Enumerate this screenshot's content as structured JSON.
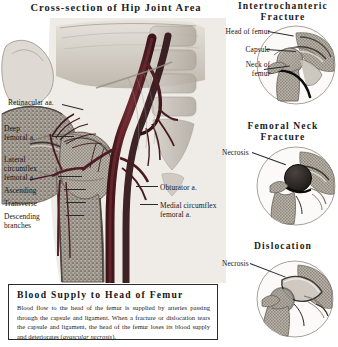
{
  "main": {
    "title": "Cross-section of Hip Joint Area",
    "labels": {
      "retinacular": "Retinacular aa.",
      "deep_femoral": "Deep\nfemoral a.",
      "lateral_circumflex": "Lateral\ncircumflex\nfemoral a.",
      "ascending": "Ascending",
      "transverse": "Transverse",
      "descending": "Descending\nbranches",
      "obturator": "Obturator a.",
      "medial_circumflex": "Medial circumflex\nfemoral a."
    }
  },
  "insets": [
    {
      "title": "Intertrochanteric\nFracture",
      "labels": [
        "Head of femur",
        "Capsule",
        "Neck of\nfemur"
      ]
    },
    {
      "title": "Femoral Neck\nFracture",
      "labels": [
        "Necrosis"
      ]
    },
    {
      "title": "Dislocation",
      "labels": [
        "Necrosis"
      ]
    }
  ],
  "caption": {
    "heading": "Blood Supply to Head of Femur",
    "body_part1": "Blood flow to the head of the femur is supplied by arteries passing through the capsule and ligament. When a fracture or dislocation tears the capsule and ligament, the head of the femur loses its blood supply and deteriorates (",
    "body_italic": "avascular necrosis",
    "body_part2": ")."
  },
  "colors": {
    "ink": "#1a1a1a",
    "artery": "#5a2128",
    "bone_light": "#d8d3cb",
    "bone_mid": "#a9a298",
    "bone_dark": "#6e675e",
    "cartilage": "#c9c4bc",
    "necrosis": "#241f1d",
    "muscle": "#b7b0a6",
    "box_border": "#2b2b2b"
  }
}
